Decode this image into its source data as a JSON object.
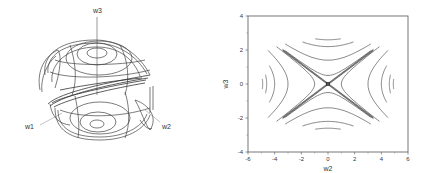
{
  "figure_left": {
    "type": "3d-wireframe-surface",
    "axis_labels": {
      "x": "w1",
      "y": "w2",
      "z": "w3"
    }
  },
  "chart_data": {
    "type": "contour",
    "title": "",
    "xlabel": "w2",
    "ylabel": "w3",
    "xlim": [
      -6,
      6
    ],
    "ylim": [
      -4,
      4
    ],
    "xticks": [
      -6,
      -4,
      -2,
      0,
      2,
      4,
      6
    ],
    "yticks": [
      -4,
      -2,
      0,
      2,
      4
    ],
    "xtick_labels": [
      "-6",
      "-4",
      "-2",
      "0",
      "2",
      "4",
      "6"
    ],
    "ytick_labels": [
      "-4",
      "-2",
      "0",
      "2",
      "4"
    ],
    "grid": false,
    "saddle_point": [
      0,
      0
    ],
    "contours_horizontal_opening": [
      {
        "vertex_x": 1.0
      },
      {
        "vertex_x": 3.0
      },
      {
        "vertex_x": 4.0
      },
      {
        "vertex_x": 4.6
      },
      {
        "vertex_x": 4.9
      }
    ],
    "contours_vertical_opening": [
      {
        "vertex_y": 0.5
      },
      {
        "vertex_y": 1.4
      },
      {
        "vertex_y": 2.2
      },
      {
        "vertex_y": 2.6
      }
    ],
    "asymptote_endpoints": [
      [
        -3.4,
        2.0
      ],
      [
        3.4,
        -2.0
      ],
      [
        -3.4,
        -2.0
      ],
      [
        3.4,
        2.0
      ]
    ]
  }
}
